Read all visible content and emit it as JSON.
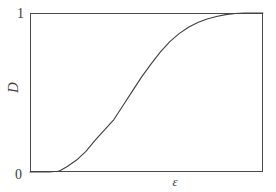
{
  "figure": {
    "background_color": "#ffffff",
    "line_color": "#3f3f3f",
    "frame_color": "#4a4a4a"
  },
  "axes": {
    "y_max_label": "1",
    "y_min_label": "0",
    "y_axis_label": "D",
    "x_axis_label": "ε"
  },
  "chart_data": {
    "type": "line",
    "title": "",
    "subtitle": "",
    "xlabel": "ε",
    "ylabel": "D",
    "xlim": [
      0,
      1
    ],
    "ylim": [
      0,
      1
    ],
    "grid": false,
    "legend": null,
    "xticks": [
      0
    ],
    "xticklabels": [
      "0"
    ],
    "yticks": [
      0,
      1
    ],
    "yticklabels": [
      "0",
      "1"
    ],
    "annotations": [],
    "series": [
      {
        "name": "damage-evolution",
        "color": "#3f3f3f",
        "x": [
          0.0,
          0.04,
          0.08,
          0.12,
          0.13,
          0.16,
          0.2,
          0.24,
          0.28,
          0.32,
          0.36,
          0.4,
          0.44,
          0.48,
          0.52,
          0.56,
          0.6,
          0.64,
          0.68,
          0.72,
          0.76,
          0.8,
          0.84,
          0.88,
          0.92,
          0.96,
          1.0
        ],
        "y": [
          0.0,
          0.0,
          0.0,
          0.005,
          0.01,
          0.035,
          0.075,
          0.13,
          0.2,
          0.265,
          0.33,
          0.42,
          0.51,
          0.6,
          0.68,
          0.755,
          0.82,
          0.87,
          0.91,
          0.94,
          0.962,
          0.978,
          0.99,
          0.997,
          1.0,
          1.0,
          1.0
        ]
      }
    ]
  }
}
